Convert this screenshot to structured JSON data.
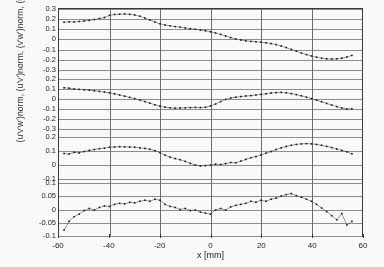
{
  "figure": {
    "xlabel": "x [mm]",
    "ylabel": "(u'v'w')norm, (u'v')norm, (v'w')norm, (u'w')norm",
    "background_color": "#fbfbfa",
    "axis_color": "#3a3a3a",
    "grid_color": "#8e8e8e",
    "marker_color": "#151515"
  },
  "axes": {
    "x": {
      "label": "x [mm]",
      "min": -60,
      "max": 60,
      "ticks": [
        -60,
        -40,
        -20,
        0,
        20,
        40,
        60
      ],
      "ticklabels": [
        "-60",
        "-40",
        "-20",
        "0",
        "20",
        "40",
        "60"
      ],
      "unit": "mm"
    }
  },
  "chart_data": [
    {
      "type": "line",
      "panel": 1,
      "title": "",
      "xlabel": "x [mm]",
      "ylabel": "(u'w')norm",
      "legend": [],
      "grid": true,
      "xlim": [
        -60,
        60
      ],
      "ylim": [
        -0.35,
        0.3
      ],
      "yticks": [
        0.3,
        0.2,
        0.1,
        0,
        -0.1,
        -0.2,
        -0.3
      ],
      "yticklabels": [
        "0.3",
        "0.2",
        "0.1",
        "0",
        "-0.1",
        "-0.2",
        "-0.3"
      ],
      "x": [
        -58,
        -56,
        -54,
        -52,
        -50,
        -48,
        -46,
        -44,
        -42,
        -40,
        -38,
        -36,
        -34,
        -32,
        -30,
        -28,
        -26,
        -24,
        -22,
        -20,
        -18,
        -16,
        -14,
        -12,
        -10,
        -8,
        -6,
        -4,
        -2,
        0,
        2,
        4,
        6,
        8,
        10,
        12,
        14,
        16,
        18,
        20,
        22,
        24,
        26,
        28,
        30,
        32,
        34,
        36,
        38,
        40,
        42,
        44,
        46,
        48,
        50,
        52,
        54,
        56
      ],
      "values": [
        0.168,
        0.172,
        0.17,
        0.175,
        0.18,
        0.186,
        0.195,
        0.205,
        0.215,
        0.236,
        0.245,
        0.248,
        0.25,
        0.247,
        0.24,
        0.228,
        0.21,
        0.19,
        0.17,
        0.152,
        0.14,
        0.132,
        0.124,
        0.118,
        0.11,
        0.103,
        0.097,
        0.09,
        0.082,
        0.072,
        0.06,
        0.046,
        0.03,
        0.014,
        0.0,
        -0.01,
        -0.018,
        -0.024,
        -0.028,
        -0.032,
        -0.038,
        -0.046,
        -0.056,
        -0.07,
        -0.086,
        -0.104,
        -0.122,
        -0.14,
        -0.156,
        -0.17,
        -0.182,
        -0.192,
        -0.198,
        -0.2,
        -0.198,
        -0.192,
        -0.18,
        -0.164
      ]
    },
    {
      "type": "line",
      "panel": 2,
      "title": "",
      "xlabel": "x [mm]",
      "ylabel": "(v'w')norm",
      "legend": [],
      "grid": true,
      "xlim": [
        -60,
        60
      ],
      "ylim": [
        -0.35,
        0.25
      ],
      "yticks": [
        0.2,
        0.1,
        0,
        -0.1,
        -0.2,
        -0.3
      ],
      "yticklabels": [
        "0.2",
        "0.1",
        "0",
        "-0.1",
        "-0.2",
        "-0.3"
      ],
      "x": [
        -58,
        -56,
        -54,
        -52,
        -50,
        -48,
        -46,
        -44,
        -42,
        -40,
        -38,
        -36,
        -34,
        -32,
        -30,
        -28,
        -26,
        -24,
        -22,
        -20,
        -18,
        -16,
        -14,
        -12,
        -10,
        -8,
        -6,
        -4,
        -2,
        0,
        2,
        4,
        6,
        8,
        10,
        12,
        14,
        16,
        18,
        20,
        22,
        24,
        26,
        28,
        30,
        32,
        34,
        36,
        38,
        40,
        42,
        44,
        46,
        48,
        50,
        52,
        54,
        56
      ],
      "values": [
        0.112,
        0.108,
        0.1,
        0.096,
        0.092,
        0.088,
        0.082,
        0.076,
        0.07,
        0.062,
        0.052,
        0.04,
        0.028,
        0.016,
        0.004,
        -0.01,
        -0.026,
        -0.042,
        -0.058,
        -0.072,
        -0.082,
        -0.088,
        -0.092,
        -0.09,
        -0.088,
        -0.086,
        -0.084,
        -0.086,
        -0.082,
        -0.07,
        -0.05,
        -0.026,
        -0.004,
        0.01,
        0.018,
        0.024,
        0.03,
        0.034,
        0.04,
        0.046,
        0.052,
        0.06,
        0.064,
        0.066,
        0.062,
        0.054,
        0.044,
        0.032,
        0.018,
        0.004,
        -0.012,
        -0.028,
        -0.044,
        -0.06,
        -0.076,
        -0.09,
        -0.1,
        -0.098
      ]
    },
    {
      "type": "line",
      "panel": 3,
      "title": "",
      "xlabel": "x [mm]",
      "ylabel": "(u'v')norm",
      "legend": [],
      "grid": true,
      "xlim": [
        -60,
        60
      ],
      "ylim": [
        -0.12,
        0.22
      ],
      "yticks": [
        0.2,
        0.1,
        0,
        -0.1
      ],
      "yticklabels": [
        "0.2",
        "0.1",
        "0",
        "-0.1"
      ],
      "x": [
        -58,
        -56,
        -54,
        -52,
        -50,
        -48,
        -46,
        -44,
        -42,
        -40,
        -38,
        -36,
        -34,
        -32,
        -30,
        -28,
        -26,
        -24,
        -22,
        -20,
        -18,
        -16,
        -14,
        -12,
        -10,
        -8,
        -6,
        -4,
        -2,
        0,
        2,
        4,
        6,
        8,
        10,
        12,
        14,
        16,
        18,
        20,
        22,
        24,
        26,
        28,
        30,
        32,
        34,
        36,
        38,
        40,
        42,
        44,
        46,
        48,
        50,
        52,
        54,
        56
      ],
      "values": [
        0.082,
        0.078,
        0.09,
        0.086,
        0.096,
        0.104,
        0.11,
        0.116,
        0.12,
        0.126,
        0.128,
        0.13,
        0.129,
        0.128,
        0.126,
        0.122,
        0.118,
        0.112,
        0.102,
        0.088,
        0.07,
        0.056,
        0.046,
        0.038,
        0.026,
        0.012,
        0.0,
        -0.006,
        -0.004,
        0.0,
        0.006,
        0.004,
        0.01,
        0.018,
        0.016,
        0.028,
        0.04,
        0.052,
        0.06,
        0.072,
        0.084,
        0.096,
        0.11,
        0.122,
        0.132,
        0.14,
        0.146,
        0.15,
        0.152,
        0.15,
        0.146,
        0.14,
        0.132,
        0.124,
        0.114,
        0.104,
        0.094,
        0.08
      ]
    },
    {
      "type": "line",
      "panel": 4,
      "title": "",
      "xlabel": "x [mm]",
      "ylabel": "(u'v'w')norm",
      "legend": [],
      "grid": true,
      "xlim": [
        -60,
        60
      ],
      "ylim": [
        -0.105,
        0.105
      ],
      "yticks": [
        0.1,
        0.05,
        0,
        -0.05,
        -0.1
      ],
      "yticklabels": [
        "0.1",
        "0.05",
        "0",
        "-0.05",
        "-0.1"
      ],
      "x": [
        -58,
        -56,
        -54,
        -52,
        -50,
        -48,
        -46,
        -44,
        -42,
        -40,
        -38,
        -36,
        -34,
        -32,
        -30,
        -28,
        -26,
        -24,
        -22,
        -20,
        -18,
        -16,
        -14,
        -12,
        -10,
        -8,
        -6,
        -4,
        -2,
        0,
        2,
        4,
        6,
        8,
        10,
        12,
        14,
        16,
        18,
        20,
        22,
        24,
        26,
        28,
        30,
        32,
        34,
        36,
        38,
        40,
        42,
        44,
        46,
        48,
        50,
        52,
        54,
        56
      ],
      "values": [
        -0.082,
        -0.048,
        -0.03,
        -0.02,
        -0.006,
        0.002,
        -0.004,
        0.006,
        0.012,
        0.01,
        0.018,
        0.022,
        0.02,
        0.026,
        0.024,
        0.03,
        0.034,
        0.03,
        0.038,
        0.034,
        0.018,
        0.01,
        0.006,
        -0.002,
        0.002,
        -0.006,
        -0.004,
        -0.012,
        -0.016,
        -0.02,
        -0.004,
        0.002,
        -0.004,
        0.008,
        0.014,
        0.018,
        0.022,
        0.03,
        0.026,
        0.034,
        0.03,
        0.038,
        0.042,
        0.05,
        0.056,
        0.06,
        0.052,
        0.046,
        0.038,
        0.03,
        0.018,
        0.004,
        -0.01,
        -0.026,
        -0.042,
        -0.018,
        -0.062,
        -0.048
      ]
    }
  ]
}
